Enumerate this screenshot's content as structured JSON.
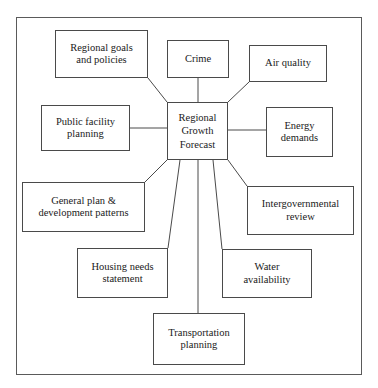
{
  "diagram": {
    "type": "hub-and-spoke",
    "frame": {
      "border_color": "#5a5a5a"
    },
    "line_color": "#4a4a4a",
    "center": {
      "id": "regional-growth-forecast",
      "label": "Regional\nGrowth\nForecast",
      "x": 167,
      "y": 102,
      "w": 61,
      "h": 58
    },
    "nodes": [
      {
        "id": "regional-goals-and-policies",
        "label": "Regional goals\nand policies",
        "x": 55,
        "y": 30,
        "w": 93,
        "h": 48
      },
      {
        "id": "crime",
        "label": "Crime",
        "x": 167,
        "y": 40,
        "w": 62,
        "h": 38
      },
      {
        "id": "air-quality",
        "label": "Air quality",
        "x": 249,
        "y": 45,
        "w": 78,
        "h": 37
      },
      {
        "id": "public-facility-planning",
        "label": "Public facility\nplanning",
        "x": 41,
        "y": 105,
        "w": 89,
        "h": 46
      },
      {
        "id": "energy-demands",
        "label": "Energy\ndemands",
        "x": 266,
        "y": 107,
        "w": 67,
        "h": 50
      },
      {
        "id": "general-plan-and-development-patterns",
        "label": "General plan &\ndevelopment patterns",
        "x": 22,
        "y": 182,
        "w": 123,
        "h": 50
      },
      {
        "id": "intergovernmental-review",
        "label": "Intergovernmental\nreview",
        "x": 247,
        "y": 186,
        "w": 107,
        "h": 49
      },
      {
        "id": "housing-needs-statement",
        "label": "Housing needs\nstatement",
        "x": 77,
        "y": 248,
        "w": 91,
        "h": 50
      },
      {
        "id": "water-availability",
        "label": "Water\navailability",
        "x": 222,
        "y": 249,
        "w": 90,
        "h": 49
      },
      {
        "id": "transportation-planning",
        "label": "Transportation\nplanning",
        "x": 153,
        "y": 313,
        "w": 92,
        "h": 52
      }
    ],
    "connectors": [
      {
        "id": "center-to-regional-goals",
        "from": "regional-growth-forecast",
        "to": "regional-goals-and-policies",
        "x1": 167,
        "y1": 102,
        "x2": 148,
        "y2": 78
      },
      {
        "id": "center-to-crime",
        "from": "regional-growth-forecast",
        "to": "crime",
        "x1": 198,
        "y1": 102,
        "x2": 198,
        "y2": 78
      },
      {
        "id": "center-to-air-quality",
        "from": "regional-growth-forecast",
        "to": "air-quality",
        "x1": 228,
        "y1": 102,
        "x2": 249,
        "y2": 82
      },
      {
        "id": "center-to-public-facility-planning",
        "from": "regional-growth-forecast",
        "to": "public-facility-planning",
        "x1": 167,
        "y1": 128,
        "x2": 130,
        "y2": 128
      },
      {
        "id": "center-to-energy-demands",
        "from": "regional-growth-forecast",
        "to": "energy-demands",
        "x1": 228,
        "y1": 130,
        "x2": 266,
        "y2": 130
      },
      {
        "id": "center-to-general-plan",
        "from": "regional-growth-forecast",
        "to": "general-plan-and-development-patterns",
        "x1": 167,
        "y1": 160,
        "x2": 145,
        "y2": 182
      },
      {
        "id": "center-to-housing-needs",
        "from": "regional-growth-forecast",
        "to": "housing-needs-statement",
        "x1": 180,
        "y1": 160,
        "x2": 168,
        "y2": 248
      },
      {
        "id": "center-to-transportation-planning",
        "from": "regional-growth-forecast",
        "to": "transportation-planning",
        "x1": 198,
        "y1": 160,
        "x2": 198,
        "y2": 313
      },
      {
        "id": "center-to-water-availability",
        "from": "regional-growth-forecast",
        "to": "water-availability",
        "x1": 213,
        "y1": 160,
        "x2": 222,
        "y2": 249
      },
      {
        "id": "center-to-intergovernmental-review",
        "from": "regional-growth-forecast",
        "to": "intergovernmental-review",
        "x1": 228,
        "y1": 160,
        "x2": 247,
        "y2": 186
      }
    ]
  }
}
